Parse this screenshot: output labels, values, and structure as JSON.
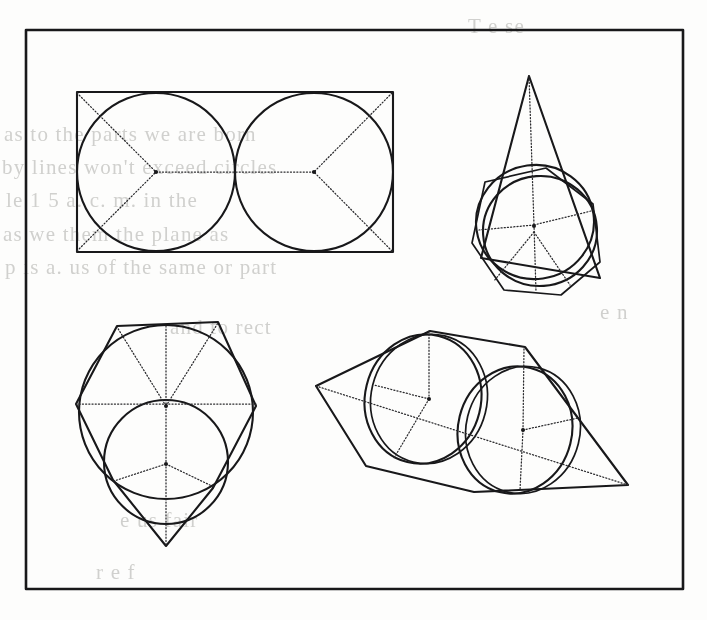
{
  "plate": {
    "title": "Geometric construction plate",
    "description": "Four line-drawn geometric figures inside a rectangular frame",
    "background_color": "#fdfdfc",
    "ink_color": "#18181a",
    "dotted_color": "#2a2a2d",
    "bleed_color": "#c9c9c6",
    "frame": {
      "x": 26,
      "y": 30,
      "width": 657,
      "height": 559
    }
  },
  "figures": [
    {
      "id": "figure-top-left",
      "name": "rectangle-with-two-inscribed-circles",
      "caption": "Rectangle containing two tangent inscribed circles with dotted radii and diagonals",
      "bounds": {
        "x": 77,
        "y": 92,
        "width": 316,
        "height": 160
      },
      "solid_shapes": [
        "rectangle",
        "circle-left",
        "circle-right"
      ],
      "dotted_lines": [
        "diagonal-to-left-center",
        "center-to-center axis",
        "diagonal-to-right-center"
      ],
      "centers": [
        {
          "x": 156,
          "y": 172
        },
        {
          "x": 314,
          "y": 172
        }
      ],
      "circle_radius": 79
    },
    {
      "id": "figure-top-right",
      "name": "cone-over-polygon-and-circles",
      "caption": "Tall isosceles triangle (cone) above a polygon with two offset concentric circles and dotted spokes",
      "bounds": {
        "x": 467,
        "y": 76,
        "width": 145,
        "height": 224
      },
      "solid_shapes": [
        "triangle-apex",
        "polygon-base",
        "circle-outer",
        "circle-inner"
      ],
      "dotted_lines": [
        "apex-axis",
        "radial-spokes"
      ],
      "apex": {
        "x": 529,
        "y": 76
      },
      "circle_center": {
        "x": 538,
        "y": 225
      },
      "circle_radius": 59,
      "spoke_count": 5
    },
    {
      "id": "figure-bottom-left",
      "name": "hexagon-with-two-circles",
      "caption": "Hexagon with downward vertex, inscribed large circle and a second lower circle, dotted radii",
      "bounds": {
        "x": 76,
        "y": 318,
        "width": 180,
        "height": 228
      },
      "solid_shapes": [
        "hexagon",
        "circle-large",
        "circle-lower"
      ],
      "dotted_lines": [
        "horizontal-axis",
        "vertical-axis",
        "radial-spokes"
      ],
      "upper_center": {
        "x": 166,
        "y": 408
      },
      "lower_center": {
        "x": 166,
        "y": 463
      },
      "spoke_count": 6
    },
    {
      "id": "figure-bottom-right",
      "name": "tilted-cylinder-between-cones",
      "caption": "Tilted quadrilateral envelope with two overlapping circles and dotted radial construction lines",
      "bounds": {
        "x": 314,
        "y": 330,
        "width": 314,
        "height": 163
      },
      "solid_shapes": [
        "polygon-envelope",
        "circle-upper-left",
        "circle-lower-right"
      ],
      "dotted_lines": [
        "long-axis",
        "radial-spokes"
      ],
      "left_tip": {
        "x": 316,
        "y": 386
      },
      "right_tip": {
        "x": 628,
        "y": 485
      },
      "circle_a_center": {
        "x": 424,
        "y": 399
      },
      "circle_a_radius": 58,
      "circle_b_center": {
        "x": 520,
        "y": 430
      },
      "circle_b_radius": 58
    }
  ],
  "bleed_text": [
    {
      "text": "as to the parts we are born",
      "x": 4,
      "y": 122
    },
    {
      "text": "by lines won't exceed circles",
      "x": 2,
      "y": 155
    },
    {
      "text": "le 1 5 a. c. m. in the",
      "x": 6,
      "y": 188
    },
    {
      "text": "as we them the plane as",
      "x": 3,
      "y": 222
    },
    {
      "text": "p is a. us of the same or part",
      "x": 5,
      "y": 255
    },
    {
      "text": "and to rect",
      "x": 170,
      "y": 315
    },
    {
      "text": "e us fair",
      "x": 120,
      "y": 508
    },
    {
      "text": "r e f",
      "x": 96,
      "y": 560
    },
    {
      "text": "T e se",
      "x": 468,
      "y": 14
    },
    {
      "text": "e n",
      "x": 600,
      "y": 300
    }
  ]
}
